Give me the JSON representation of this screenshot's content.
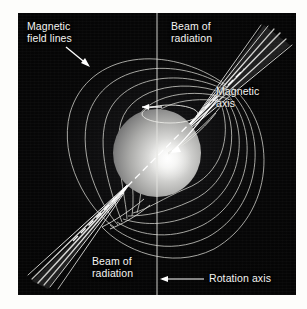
{
  "figure": {
    "background_color": "#050505",
    "frame_color": "#050505",
    "page_background": "#fdfdfb",
    "label_color": "#f4f4f2",
    "line_color": "#d8d8d4",
    "beam_color": "#ffffff"
  },
  "labels": {
    "magnetic_field_lines": "Magnetic\nfield lines",
    "beam_of_radiation_top": "Beam of\nradiation",
    "magnetic_axis": "Magnetic\naxis",
    "beam_of_radiation_bottom": "Beam of\nradiation",
    "rotation_axis": "Rotation axis"
  },
  "diagram_data": {
    "type": "schematic",
    "panel": {
      "x": 18,
      "y": 13,
      "width": 278,
      "height": 282
    },
    "star": {
      "name": "neutron-star-sphere",
      "center": [
        139,
        140
      ],
      "radius": 44,
      "highlight_center": [
        150,
        146
      ],
      "shading": "radial-gradient bright core to dark limb"
    },
    "rotation_axis": {
      "name": "rotation-axis-line",
      "orientation": "vertical",
      "x": 139,
      "y_from": 0,
      "y_to": 282,
      "style": "solid thin white"
    },
    "magnetic_axis": {
      "name": "magnetic-axis-line",
      "orientation": "tilted",
      "tilt_degrees_from_rotation_axis": 45,
      "from": [
        60,
        224
      ],
      "to": [
        222,
        60
      ],
      "style": "dashed white through sphere"
    },
    "rotation_indicator": {
      "name": "rotation-direction-ellipse",
      "center": [
        152,
        101
      ],
      "rx": 28,
      "ry": 9,
      "arrow_direction": "left",
      "meaning": "spin direction"
    },
    "beams": [
      {
        "name": "beam-of-radiation-north",
        "apex": [
          215,
          67
        ],
        "direction_degrees": 45,
        "ray_count": 6,
        "label": "Beam of radiation",
        "quadrant": "upper-right"
      },
      {
        "name": "beam-of-radiation-south",
        "apex": [
          66,
          218
        ],
        "direction_degrees": 225,
        "ray_count": 6,
        "label": "Beam of radiation",
        "quadrant": "lower-left"
      }
    ],
    "field_lines": {
      "name": "magnetic-field-lines",
      "loops_per_side": 6,
      "sides": [
        "left-upper",
        "right-lower"
      ],
      "description": "dipole loops from north magnetic pole around to south magnetic pole"
    },
    "pointers": [
      {
        "name": "pointer-magnetic-field-lines",
        "from": [
          52,
          38
        ],
        "to": [
          73,
          54
        ],
        "arrow_at": "to",
        "style": "straight"
      },
      {
        "name": "pointer-magnetic-axis",
        "from": [
          196,
          86
        ],
        "to": [
          150,
          139
        ],
        "arrow_at": "to",
        "style": "curved"
      },
      {
        "name": "pointer-rotation-axis",
        "from": [
          186,
          266
        ],
        "to": [
          141,
          266
        ],
        "arrow_at": "to",
        "style": "straight"
      }
    ]
  }
}
